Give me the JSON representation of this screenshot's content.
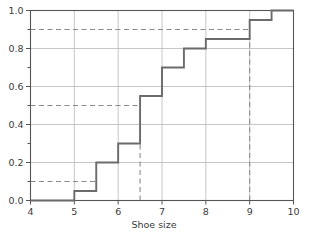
{
  "chart_data": {
    "type": "line",
    "subtype": "step-ecdf",
    "title": "",
    "xlabel": "Shoe size",
    "ylabel": "",
    "xlim": [
      4,
      10
    ],
    "ylim": [
      0.0,
      1.0
    ],
    "grid": true,
    "legend": "none",
    "x_ticks": [
      4,
      5,
      6,
      7,
      8,
      9,
      10
    ],
    "x_tick_labels": [
      "4",
      "5",
      "6",
      "7",
      "8",
      "9",
      "10"
    ],
    "y_ticks": [
      0.0,
      0.2,
      0.4,
      0.6,
      0.8,
      1.0
    ],
    "y_tick_labels": [
      "0.0",
      "0.2",
      "0.4",
      "0.6",
      "0.8",
      "1.0"
    ],
    "y_minor_ticks": [
      0.1,
      0.3,
      0.5,
      0.7,
      0.9
    ],
    "x": [
      4,
      5,
      5,
      5.5,
      5.5,
      6,
      6,
      6.5,
      6.5,
      7,
      7,
      7.5,
      7.5,
      8,
      8,
      9,
      9,
      9.5,
      9.5,
      10
    ],
    "y": [
      0.0,
      0.0,
      0.05,
      0.05,
      0.2,
      0.2,
      0.3,
      0.3,
      0.55,
      0.55,
      0.7,
      0.7,
      0.8,
      0.8,
      0.85,
      0.85,
      0.95,
      0.95,
      1.0,
      1.0
    ],
    "steps": [
      {
        "x": 5.0,
        "y": 0.05
      },
      {
        "x": 5.5,
        "y": 0.2
      },
      {
        "x": 6.0,
        "y": 0.3
      },
      {
        "x": 6.5,
        "y": 0.55
      },
      {
        "x": 7.0,
        "y": 0.7
      },
      {
        "x": 7.5,
        "y": 0.8
      },
      {
        "x": 8.0,
        "y": 0.85
      },
      {
        "x": 9.0,
        "y": 0.95
      },
      {
        "x": 9.5,
        "y": 1.0
      }
    ],
    "reference_lines": [
      {
        "name": "decile-10",
        "orientation": "horizontal",
        "y": 0.1,
        "x_from": 4,
        "x_to": 5.5,
        "style": "dashed"
      },
      {
        "name": "median-50",
        "orientation": "horizontal",
        "y": 0.5,
        "x_from": 4,
        "x_to": 6.5,
        "style": "dashed"
      },
      {
        "name": "decile-90",
        "orientation": "horizontal",
        "y": 0.9,
        "x_from": 4,
        "x_to": 9.0,
        "style": "dashed"
      },
      {
        "name": "median-drop",
        "orientation": "vertical",
        "x": 6.5,
        "y_from": 0.0,
        "y_to": 0.5,
        "style": "dashed"
      },
      {
        "name": "decile-90-drop",
        "orientation": "vertical",
        "x": 9.0,
        "y_from": 0.0,
        "y_to": 0.9,
        "style": "dashed"
      }
    ],
    "colors": {
      "step_line": "#6b6b6b",
      "grid": "#b8b8b8",
      "axis": "#555555",
      "dashed": "#8a8a8a",
      "text": "#3a3a3a",
      "background": "#ffffff"
    }
  },
  "axis": {
    "x_title": "Shoe size"
  }
}
